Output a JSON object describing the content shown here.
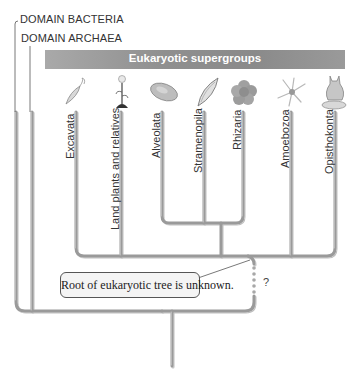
{
  "domains": {
    "bacteria": "DOMAIN BACTERIA",
    "archaea": "DOMAIN ARCHAEA"
  },
  "banner": {
    "title": "Eukaryotic supergroups"
  },
  "supergroups": [
    {
      "label": "Excavata",
      "icon": "flagellate-icon"
    },
    {
      "label": "Land plants and relatives",
      "icon": "plant-icon"
    },
    {
      "label": "Alveolata",
      "icon": "ciliate-icon"
    },
    {
      "label": "Stramenopila",
      "icon": "diatom-icon"
    },
    {
      "label": "Rhizaria",
      "icon": "foraminifera-icon"
    },
    {
      "label": "Amoebozoa",
      "icon": "amoeba-icon"
    },
    {
      "label": "Opisthokonta",
      "icon": "cat-mushroom-icon"
    }
  ],
  "callout": {
    "text": "Root of eukaryotic tree is unknown."
  },
  "uncertainty_mark": "?",
  "colors": {
    "branch": "#9a9a9a",
    "branch_highlight": "#c8c8c8",
    "banner": "#8f8f8f",
    "banner_text": "#ffffff"
  }
}
